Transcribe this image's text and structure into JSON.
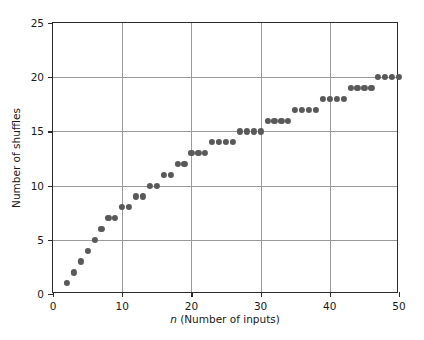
{
  "chart_data": {
    "type": "scatter",
    "title": "",
    "xlabel_italic": "n",
    "xlabel_rest": " (Number of inputs)",
    "xlabel": "n (Number of inputs)",
    "ylabel": "Number of shuffles",
    "xlim": [
      0,
      50
    ],
    "ylim": [
      0,
      25
    ],
    "xticks": [
      0,
      10,
      20,
      30,
      40,
      50
    ],
    "yticks": [
      0,
      5,
      10,
      15,
      20,
      25
    ],
    "xtick_labels": [
      "0",
      "10",
      "20",
      "30",
      "40",
      "50"
    ],
    "ytick_labels": [
      "0",
      "5",
      "10",
      "15",
      "20",
      "25"
    ],
    "grid": true,
    "grid_color": "#9a9a9a",
    "marker_color": "#595959",
    "marker_size": 6,
    "legend": null,
    "series_name": "shuffles",
    "x": [
      2,
      3,
      4,
      5,
      6,
      7,
      8,
      9,
      10,
      11,
      12,
      13,
      14,
      15,
      16,
      17,
      18,
      19,
      20,
      21,
      22,
      23,
      24,
      25,
      26,
      27,
      28,
      29,
      30,
      31,
      32,
      33,
      34,
      35,
      36,
      37,
      38,
      39,
      40,
      41,
      42,
      43,
      44,
      45,
      46,
      47,
      48,
      49,
      50
    ],
    "y": [
      1,
      2,
      3,
      4,
      5,
      6,
      7,
      7,
      8,
      8,
      9,
      9,
      10,
      10,
      11,
      11,
      12,
      12,
      13,
      13,
      13,
      14,
      14,
      14,
      14,
      15,
      15,
      15,
      15,
      16,
      16,
      16,
      16,
      17,
      17,
      17,
      17,
      18,
      18,
      18,
      18,
      19,
      19,
      19,
      19,
      20,
      20,
      20,
      20
    ]
  }
}
